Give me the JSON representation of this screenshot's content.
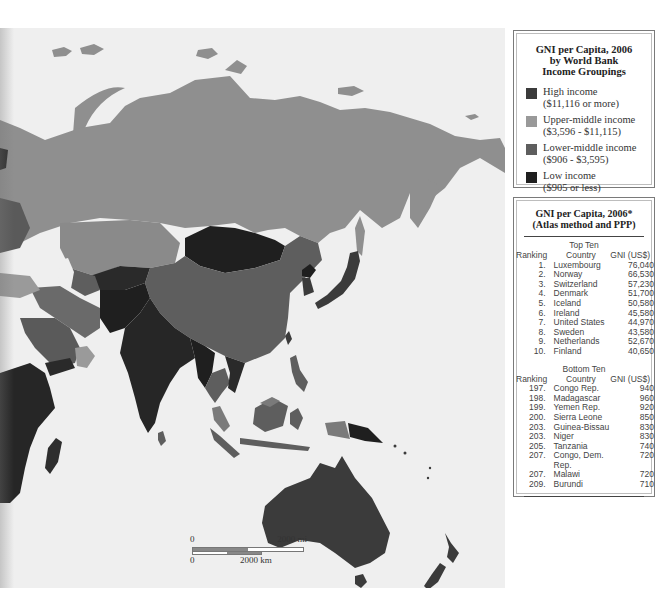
{
  "map": {
    "region": "Asia and Oceania",
    "colors": {
      "ocean": "#efefef",
      "high_income": "#3b3b3b",
      "upper_middle_income": "#999999",
      "lower_middle_income": "#5e5e5e",
      "low_income": "#1f1f1f"
    },
    "scale": {
      "mi_zero": "0",
      "mi_label": "2000 mi",
      "km_zero": "0",
      "km_label": "2000 km"
    }
  },
  "legend": {
    "title_line1": "GNI per Capita, 2006",
    "title_line2": "by World Bank",
    "title_line3": "Income Groupings",
    "items": [
      {
        "name": "High income",
        "range": "($11,116 or more)",
        "color": "#3b3b3b"
      },
      {
        "name": "Upper-middle income",
        "range": "($3,596 - $11,115)",
        "color": "#999999"
      },
      {
        "name": "Lower-middle income",
        "range": "($906 - $3,595)",
        "color": "#5e5e5e"
      },
      {
        "name": "Low income",
        "range": "($905 or less)",
        "color": "#1f1f1f"
      }
    ]
  },
  "table": {
    "title_line1": "GNI per Capita, 2006*",
    "title_line2": "(Atlas method and PPP)",
    "top": {
      "section_title": "Top Ten",
      "headers": {
        "ranking": "Ranking",
        "country": "Country",
        "gni": "GNI (US$)"
      },
      "rows": [
        {
          "rank": "1.",
          "country": "Luxembourg",
          "gni": "76,040"
        },
        {
          "rank": "2.",
          "country": "Norway",
          "gni": "66,530"
        },
        {
          "rank": "3.",
          "country": "Switzerland",
          "gni": "57,230"
        },
        {
          "rank": "4.",
          "country": "Denmark",
          "gni": "51,700"
        },
        {
          "rank": "5.",
          "country": "Iceland",
          "gni": "50,580"
        },
        {
          "rank": "6.",
          "country": "Ireland",
          "gni": "45,580"
        },
        {
          "rank": "7.",
          "country": "United States",
          "gni": "44,970"
        },
        {
          "rank": "8.",
          "country": "Sweden",
          "gni": "43,580"
        },
        {
          "rank": "9.",
          "country": "Netherlands",
          "gni": "52,670"
        },
        {
          "rank": "10.",
          "country": "Finland",
          "gni": "40,650"
        }
      ]
    },
    "bottom": {
      "section_title": "Bottom Ten",
      "headers": {
        "ranking": "Ranking",
        "country": "Country",
        "gni": "GNI (US$)"
      },
      "rows": [
        {
          "rank": "197.",
          "country": "Congo Rep.",
          "gni": "940"
        },
        {
          "rank": "198.",
          "country": "Madagascar",
          "gni": "960"
        },
        {
          "rank": "199.",
          "country": "Yemen Rep.",
          "gni": "920"
        },
        {
          "rank": "200.",
          "country": "Sierra Leone",
          "gni": "850"
        },
        {
          "rank": "203.",
          "country": "Guinea-Bissau",
          "gni": "830"
        },
        {
          "rank": "203.",
          "country": "Niger",
          "gni": "830"
        },
        {
          "rank": "205.",
          "country": "Tanzania",
          "gni": "740"
        },
        {
          "rank": "207.",
          "country": "Congo, Dem. Rep.",
          "gni": "720"
        },
        {
          "rank": "207.",
          "country": "Malawi",
          "gni": "720"
        },
        {
          "rank": "209.",
          "country": "Burundi",
          "gni": "710"
        }
      ]
    }
  }
}
